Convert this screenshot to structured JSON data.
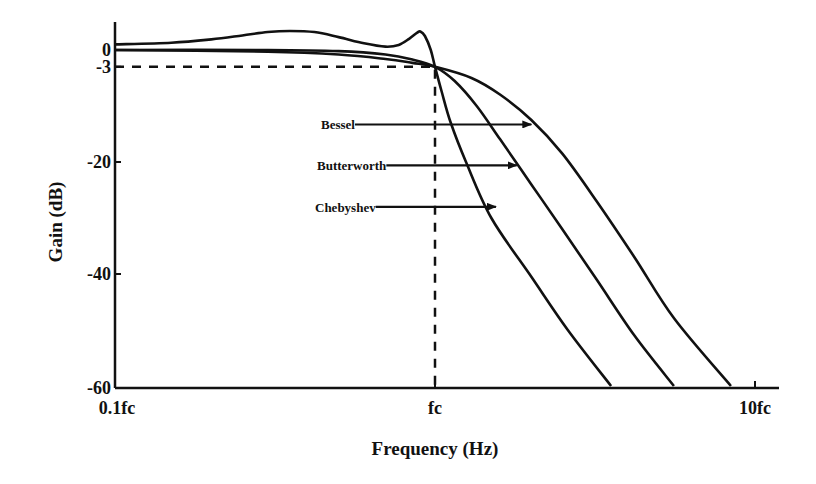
{
  "chart_data": {
    "type": "line",
    "title": "",
    "xlabel": "Frequency (Hz)",
    "ylabel": "Gain (dB)",
    "xscale": "log",
    "x_units": "f/fc",
    "xlim": [
      0.1,
      12.0
    ],
    "ylim": [
      -60,
      5
    ],
    "x_ticks": [
      {
        "value": 0.1,
        "label": "0.1fc"
      },
      {
        "value": 1,
        "label": "fc"
      },
      {
        "value": 10,
        "label": "10fc"
      }
    ],
    "y_ticks": [
      {
        "value": 0,
        "label": "0"
      },
      {
        "value": -3,
        "label": "-3"
      },
      {
        "value": -20,
        "label": "-20"
      },
      {
        "value": -40,
        "label": "-40"
      },
      {
        "value": -60,
        "label": "-60"
      }
    ],
    "grid": false,
    "reference_lines": [
      {
        "name": "cutoff-3db",
        "points": [
          [
            0.1,
            -3
          ],
          [
            1,
            -3
          ],
          [
            1,
            -60
          ]
        ],
        "style": "dashed"
      }
    ],
    "series": [
      {
        "name": "Chebyshev",
        "points": [
          [
            0.1,
            1.0
          ],
          [
            0.15,
            1.3
          ],
          [
            0.2,
            1.9
          ],
          [
            0.25,
            2.6
          ],
          [
            0.3,
            3.2
          ],
          [
            0.352,
            3.4
          ],
          [
            0.42,
            3.2
          ],
          [
            0.5,
            2.3
          ],
          [
            0.6,
            1.2
          ],
          [
            0.7,
            0.6
          ],
          [
            0.77,
            0.9
          ],
          [
            0.83,
            2.0
          ],
          [
            0.88,
            3.1
          ],
          [
            0.9,
            3.3
          ],
          [
            0.93,
            2.5
          ],
          [
            0.97,
            0.0
          ],
          [
            1.0,
            -3.0
          ],
          [
            1.05,
            -7.5
          ],
          [
            1.12,
            -13
          ],
          [
            1.25,
            -20
          ],
          [
            1.5,
            -30
          ],
          [
            2.0,
            -40.5
          ],
          [
            2.6,
            -50
          ],
          [
            3.55,
            -60
          ]
        ]
      },
      {
        "name": "Butterworth",
        "points": [
          [
            0.1,
            0.0
          ],
          [
            0.3,
            0.0
          ],
          [
            0.5,
            -0.2
          ],
          [
            0.7,
            -0.8
          ],
          [
            0.85,
            -1.7
          ],
          [
            1.0,
            -3.0
          ],
          [
            1.15,
            -5.5
          ],
          [
            1.35,
            -10
          ],
          [
            1.6,
            -16
          ],
          [
            2.0,
            -24
          ],
          [
            2.5,
            -32
          ],
          [
            3.2,
            -41
          ],
          [
            4.2,
            -51
          ],
          [
            5.58,
            -60
          ]
        ]
      },
      {
        "name": "Bessel",
        "points": [
          [
            0.1,
            0.0
          ],
          [
            0.3,
            -0.3
          ],
          [
            0.5,
            -0.8
          ],
          [
            0.7,
            -1.6
          ],
          [
            0.85,
            -2.3
          ],
          [
            1.0,
            -3.0
          ],
          [
            1.3,
            -5.0
          ],
          [
            1.6,
            -8.0
          ],
          [
            2.0,
            -12.5
          ],
          [
            2.5,
            -18.5
          ],
          [
            3.2,
            -27
          ],
          [
            4.2,
            -37
          ],
          [
            5.6,
            -48
          ],
          [
            8.41,
            -60
          ]
        ]
      }
    ],
    "annotations": [
      {
        "label": "Bessel",
        "series": "Bessel",
        "y": -13.3,
        "arrow_to_x": 2.0
      },
      {
        "label": "Butterworth",
        "series": "Butterworth",
        "y": -20.6,
        "arrow_to_x": 1.8
      },
      {
        "label": "Chebyshev",
        "series": "Chebyshev",
        "y": -28.0,
        "arrow_to_x": 1.55
      }
    ]
  }
}
